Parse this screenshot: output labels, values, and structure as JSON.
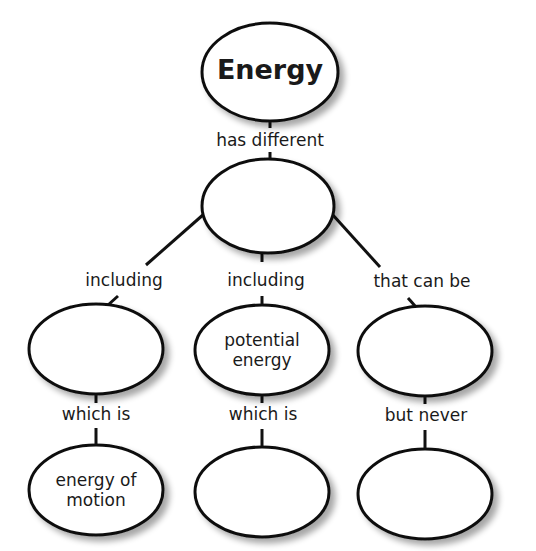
{
  "diagram": {
    "nodes": [
      {
        "id": "energy",
        "text": "Energy",
        "cx": 270,
        "cy": 72,
        "rx": 68,
        "ry": 49
      },
      {
        "id": "forms",
        "text": "",
        "cx": 268,
        "cy": 206,
        "rx": 66,
        "ry": 47
      },
      {
        "id": "left_mid",
        "text": "",
        "cx": 96,
        "cy": 349,
        "rx": 67,
        "ry": 45
      },
      {
        "id": "potential",
        "text_line1": "potential",
        "text_line2": "energy",
        "cx": 262,
        "cy": 350,
        "rx": 67,
        "ry": 45
      },
      {
        "id": "right_mid",
        "text": "",
        "cx": 425,
        "cy": 351,
        "rx": 67,
        "ry": 45
      },
      {
        "id": "kinetic",
        "text_line1": "energy of",
        "text_line2": "motion",
        "cx": 96,
        "cy": 490,
        "rx": 67,
        "ry": 45
      },
      {
        "id": "bottom_mid",
        "text": "",
        "cx": 262,
        "cy": 492,
        "rx": 67,
        "ry": 45
      },
      {
        "id": "bottom_right",
        "text": "",
        "cx": 425,
        "cy": 494,
        "rx": 67,
        "ry": 45
      }
    ],
    "links": {
      "has_different": "has different",
      "including_left": "including",
      "including_mid": "including",
      "that_can_be": "that can be",
      "which_is_left": "which is",
      "which_is_mid": "which is",
      "but_never": "but never"
    }
  }
}
